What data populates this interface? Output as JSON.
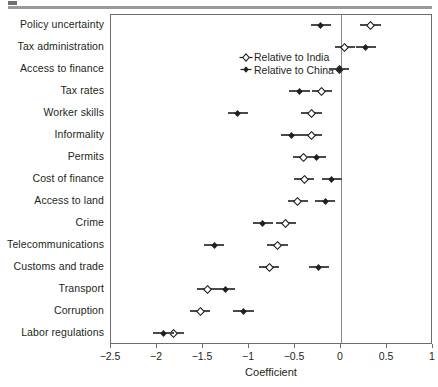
{
  "figure": {
    "header_rule": "",
    "xaxis_title": "Coefficient"
  },
  "legend": {
    "items": [
      {
        "label": "Relative to India",
        "marker": "open-diamond",
        "series": "india"
      },
      {
        "label": "Relative to China",
        "marker": "filled-diamond",
        "series": "china"
      }
    ]
  },
  "chart_data": {
    "type": "scatter",
    "title": "",
    "xlabel": "Coefficient",
    "ylabel": "",
    "xlim": [
      -2.5,
      1
    ],
    "xticks": [
      -2.5,
      -2,
      -1.5,
      -1,
      -0.5,
      0,
      0.5,
      1
    ],
    "xticklabels": [
      "−2.5",
      "−2",
      "−1.5",
      "−1",
      "−0.5",
      "0",
      "0.5",
      "1"
    ],
    "grid": false,
    "legend_position": "upper-left-inside",
    "reference_line_x": 0,
    "categories": [
      "Policy uncertainty",
      "Tax administration",
      "Access to finance",
      "Tax rates",
      "Worker skills",
      "Informality",
      "Permits",
      "Cost of finance",
      "Access to land",
      "Crime",
      "Telecommunications",
      "Customs and trade",
      "Transport",
      "Corruption",
      "Labor regulations"
    ],
    "series": [
      {
        "name": "Relative to India",
        "marker": "open-diamond",
        "values": [
          0.32,
          0.04,
          -0.02,
          -0.21,
          -0.32,
          -0.32,
          -0.41,
          -0.4,
          -0.47,
          -0.6,
          -0.69,
          -0.78,
          -1.45,
          -1.53,
          -1.82
        ],
        "ci_low": [
          0.21,
          -0.07,
          -0.13,
          -0.32,
          -0.43,
          -0.43,
          -0.52,
          -0.51,
          -0.58,
          -0.71,
          -0.8,
          -0.89,
          -1.56,
          -1.64,
          -1.93
        ],
        "ci_high": [
          0.43,
          0.15,
          0.09,
          -0.1,
          -0.21,
          -0.21,
          -0.3,
          -0.29,
          -0.36,
          -0.49,
          -0.58,
          -0.67,
          -1.34,
          -1.42,
          -1.71
        ]
      },
      {
        "name": "Relative to China",
        "marker": "filled-diamond",
        "values": [
          -0.22,
          0.27,
          -0.02,
          -0.45,
          -1.12,
          -0.54,
          -0.27,
          -0.1,
          -0.17,
          -0.85,
          -1.38,
          -0.24,
          -1.26,
          -1.06,
          -1.93
        ],
        "ci_low": [
          -0.33,
          0.16,
          -0.11,
          -0.56,
          -1.23,
          -0.65,
          -0.38,
          -0.21,
          -0.28,
          -0.96,
          -1.49,
          -0.35,
          -1.37,
          -1.17,
          -2.04
        ],
        "ci_high": [
          -0.11,
          0.38,
          0.07,
          -0.34,
          -1.01,
          -0.43,
          -0.16,
          0.01,
          -0.06,
          -0.74,
          -1.27,
          -0.13,
          -1.15,
          -0.95,
          -1.82
        ]
      }
    ]
  },
  "colors": {
    "marker": "#231f20",
    "ci": "#4a4a4a",
    "frame": "#6d6e71",
    "zero_line": "#8a8c8e",
    "text": "#231f20",
    "header_rule": "#9a9a9a"
  }
}
